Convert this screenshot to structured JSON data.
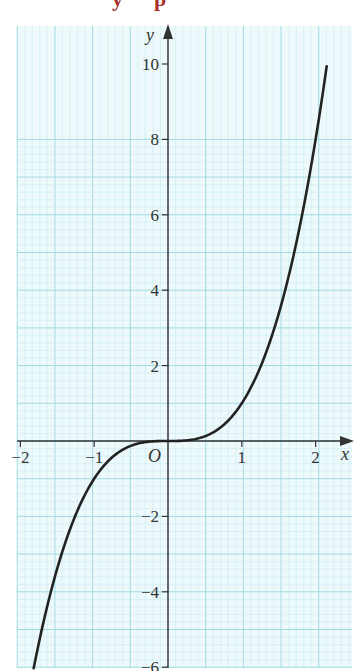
{
  "heading": {
    "fragment_1": "p",
    "fragment_2": "y",
    "color": "#a8322d"
  },
  "colors": {
    "grid_background": "#eef9fb",
    "grid_fine": "#cdeef2",
    "grid_major": "#9fdbe3",
    "axis": "#333333",
    "curve": "#222222"
  },
  "chart_data": {
    "type": "line",
    "title": "",
    "function": "y = x^3",
    "xlabel": "x",
    "ylabel": "y",
    "origin_label": "O",
    "xlim": [
      -2.05,
      2.5
    ],
    "ylim": [
      -6,
      10.5
    ],
    "grid": true,
    "x_ticks": [
      -2,
      -1,
      1,
      2
    ],
    "x_tick_labels": [
      "−2",
      "−1",
      "1",
      "2"
    ],
    "y_ticks": [
      -6,
      -4,
      -2,
      2,
      4,
      6,
      8,
      10
    ],
    "y_tick_labels": [
      "−6",
      "−4",
      "−2",
      "2",
      "4",
      "6",
      "8",
      "10"
    ],
    "series": [
      {
        "name": "y = x^3",
        "x": [
          -1.82,
          -1.5,
          -1.25,
          -1.0,
          -0.75,
          -0.5,
          -0.25,
          0,
          0.25,
          0.5,
          0.75,
          1.0,
          1.25,
          1.5,
          1.75,
          2.0,
          2.15
        ],
        "y": [
          -6.03,
          -3.38,
          -1.95,
          -1.0,
          -0.42,
          -0.13,
          -0.02,
          0,
          0.02,
          0.13,
          0.42,
          1.0,
          1.95,
          3.38,
          5.36,
          8.0,
          9.94
        ]
      }
    ]
  }
}
